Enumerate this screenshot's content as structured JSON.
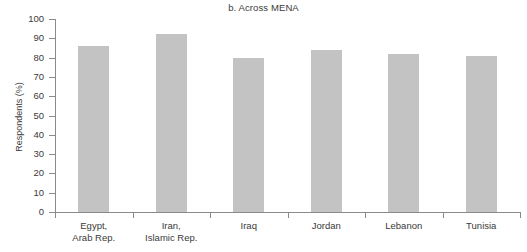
{
  "chart_data": {
    "type": "bar",
    "title": "b. Across MENA",
    "xlabel": "",
    "ylabel": "Respondents (%)",
    "ylim": [
      0,
      100
    ],
    "ytick_step": 10,
    "yticks": [
      0,
      10,
      20,
      30,
      40,
      50,
      60,
      70,
      80,
      90,
      100
    ],
    "grid": false,
    "legend": null,
    "bar_color": "#c3c3c3",
    "axis_color": "#8a8a8a",
    "text_color": "#3a3a3a",
    "categories": [
      "Egypt,\nArab Rep.",
      "Iran,\nIslamic Rep.",
      "Iraq",
      "Jordan",
      "Lebanon",
      "Tunisia"
    ],
    "category_names": [
      "Egypt, Arab Rep.",
      "Iran, Islamic Rep.",
      "Iraq",
      "Jordan",
      "Lebanon",
      "Tunisia"
    ],
    "values": [
      86,
      92,
      80,
      84,
      82,
      81
    ]
  }
}
